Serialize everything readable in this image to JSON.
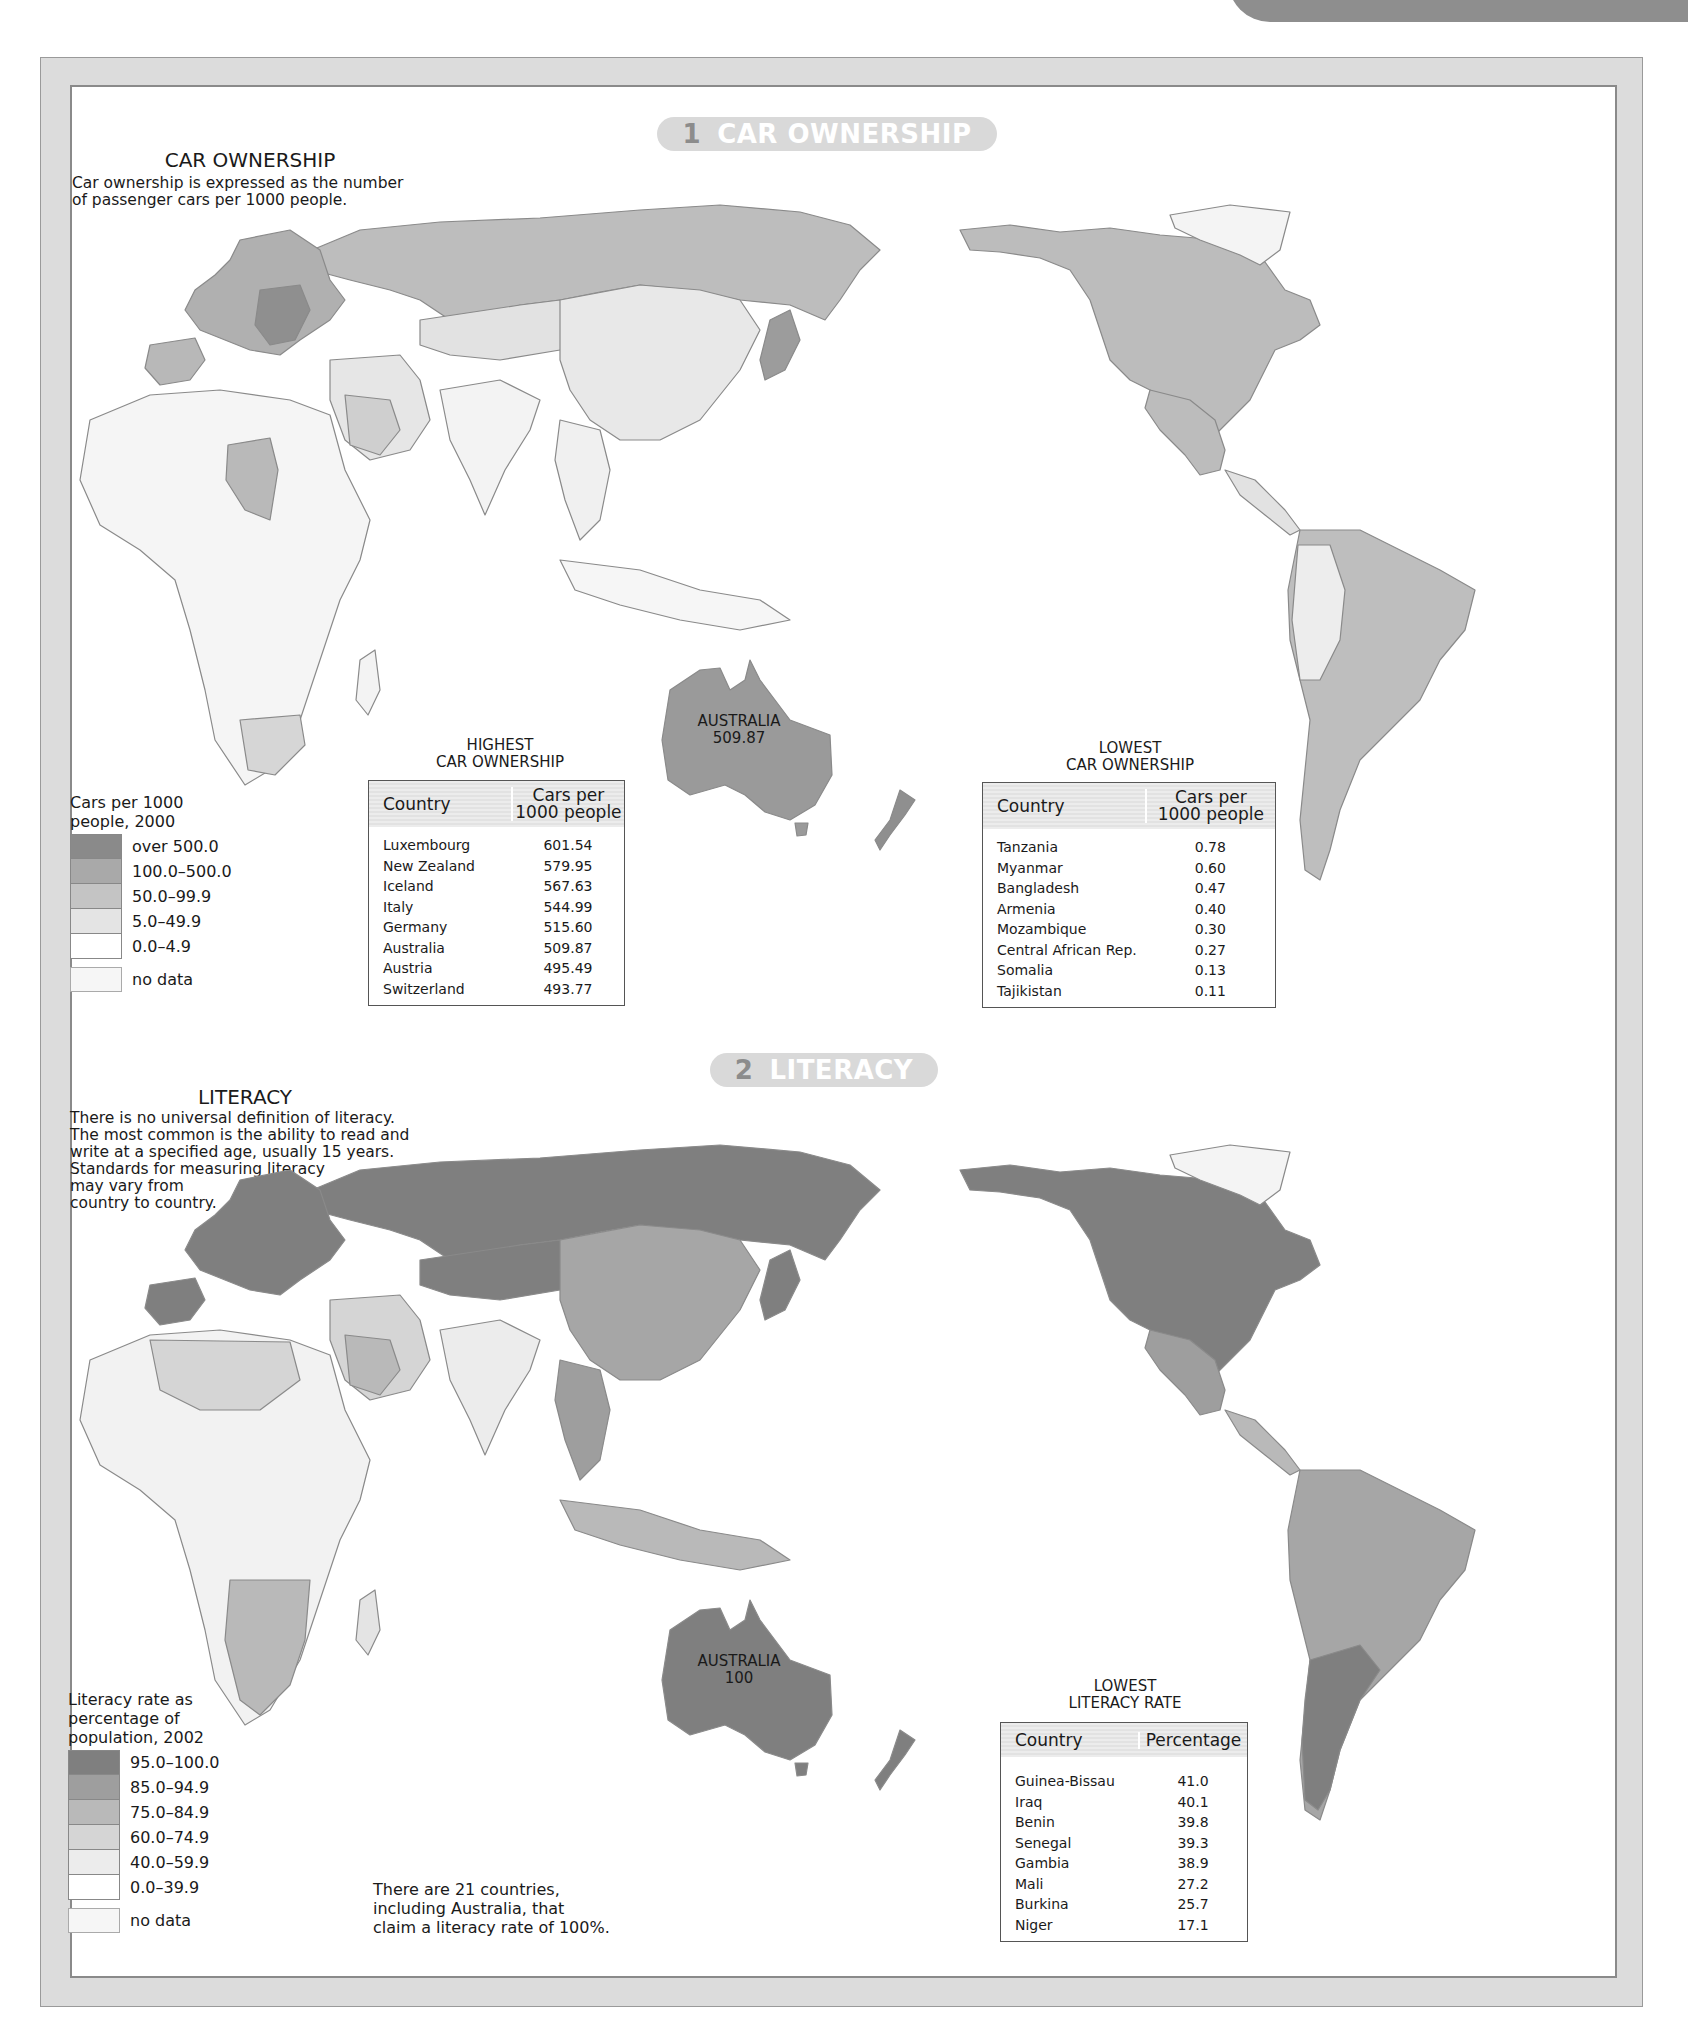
{
  "colors": {
    "frame": "#dcdcdc",
    "tab": "#8e8e8e",
    "banner_bg": "#d9d9d9",
    "banner_num": "#8c8c8c",
    "scale": [
      "#8a8a8a",
      "#a9a9a9",
      "#c4c4c4",
      "#e4e4e4",
      "#ffffff",
      "#f4f4f4"
    ],
    "literacy_scale": [
      "#7f7f7f",
      "#9e9e9e",
      "#b9b9b9",
      "#d5d5d5",
      "#ececec",
      "#ffffff",
      "#f4f4f4"
    ]
  },
  "section1": {
    "banner": {
      "number": "1",
      "label": "CAR OWNERSHIP"
    },
    "title": "CAR OWNERSHIP",
    "description": "Car ownership is expressed as the number\nof passenger cars per 1000 people.",
    "map_label": {
      "country": "AUSTRALIA",
      "value": "509.87"
    },
    "legend": {
      "heading": "Cars per 1000\npeople, 2000",
      "items": [
        {
          "label": "over 500.0"
        },
        {
          "label": "100.0–500.0"
        },
        {
          "label": "50.0–99.9"
        },
        {
          "label": "5.0–49.9"
        },
        {
          "label": "0.0–4.9"
        }
      ],
      "no_data": "no data"
    },
    "highest_table": {
      "caption": "HIGHEST\nCAR OWNERSHIP",
      "headers": [
        "Country",
        "Cars per\n1000 people"
      ],
      "rows": [
        [
          "Luxembourg",
          "601.54"
        ],
        [
          "New Zealand",
          "579.95"
        ],
        [
          "Iceland",
          "567.63"
        ],
        [
          "Italy",
          "544.99"
        ],
        [
          "Germany",
          "515.60"
        ],
        [
          "Australia",
          "509.87"
        ],
        [
          "Austria",
          "495.49"
        ],
        [
          "Switzerland",
          "493.77"
        ]
      ]
    },
    "lowest_table": {
      "caption": "LOWEST\nCAR OWNERSHIP",
      "headers": [
        "Country",
        "Cars per\n1000 people"
      ],
      "rows": [
        [
          "Tanzania",
          "0.78"
        ],
        [
          "Myanmar",
          "0.60"
        ],
        [
          "Bangladesh",
          "0.47"
        ],
        [
          "Armenia",
          "0.40"
        ],
        [
          "Mozambique",
          "0.30"
        ],
        [
          "Central African Rep.",
          "0.27"
        ],
        [
          "Somalia",
          "0.13"
        ],
        [
          "Tajikistan",
          "0.11"
        ]
      ]
    }
  },
  "section2": {
    "banner": {
      "number": "2",
      "label": "LITERACY"
    },
    "title": "LITERACY",
    "description": "There is no universal definition of literacy.\nThe most common is the ability to read and\nwrite at a specified age, usually 15 years.\nStandards for measuring literacy\nmay vary from\ncountry to country.",
    "map_label": {
      "country": "AUSTRALIA",
      "value": "100"
    },
    "legend": {
      "heading": "Literacy rate as\npercentage of\npopulation, 2002",
      "items": [
        {
          "label": "95.0–100.0"
        },
        {
          "label": "85.0–94.9"
        },
        {
          "label": "75.0–84.9"
        },
        {
          "label": "60.0–74.9"
        },
        {
          "label": "40.0–59.9"
        },
        {
          "label": "0.0–39.9"
        }
      ],
      "no_data": "no data"
    },
    "lowest_table": {
      "caption": "LOWEST\nLITERACY RATE",
      "headers": [
        "Country",
        "Percentage"
      ],
      "rows": [
        [
          "Guinea-Bissau",
          "41.0"
        ],
        [
          "Iraq",
          "40.1"
        ],
        [
          "Benin",
          "39.8"
        ],
        [
          "Senegal",
          "39.3"
        ],
        [
          "Gambia",
          "38.9"
        ],
        [
          "Mali",
          "27.2"
        ],
        [
          "Burkina",
          "25.7"
        ],
        [
          "Niger",
          "17.1"
        ]
      ]
    },
    "note": "There are 21 countries,\nincluding Australia, that\nclaim a literacy rate of 100%."
  }
}
